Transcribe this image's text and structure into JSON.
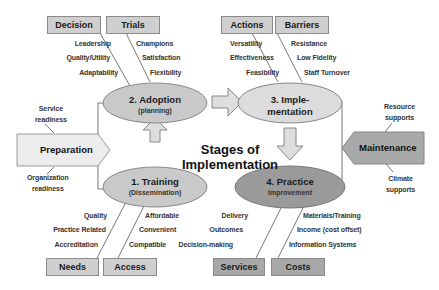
{
  "title": {
    "line1": "Stages of",
    "line2": "Implementation"
  },
  "stages": [
    {
      "id": "training",
      "title": "1. Training",
      "subtitle": "(Dissemination)",
      "fill": "#c9c9c9"
    },
    {
      "id": "adoption",
      "title": "2. Adoption",
      "subtitle": "(planning)",
      "fill": "#c9c9c9"
    },
    {
      "id": "implementation",
      "title": "3. Imple-",
      "subtitle": "mentation",
      "fill": "#dcdcdc"
    },
    {
      "id": "practice",
      "title": "4. Practice",
      "subtitle": "Improvement",
      "fill": "#9a9a9a"
    }
  ],
  "preparation": {
    "label": "Preparation",
    "top_note": [
      "Service",
      "readiness"
    ],
    "bottom_note": [
      "Organization",
      "readiness"
    ]
  },
  "maintenance": {
    "label": "Maintenance",
    "top_note": [
      "Resource",
      "supports"
    ],
    "bottom_note": [
      "Climate",
      "supports"
    ]
  },
  "factor_boxes": {
    "decision": {
      "label": "Decision",
      "items": [
        "Leadership",
        "Quality/Utility",
        "Adaptability"
      ]
    },
    "trials": {
      "label": "Trials",
      "items": [
        "Champions",
        "Satisfaction",
        "Flexibility"
      ]
    },
    "actions": {
      "label": "Actions",
      "items": [
        "Versatility",
        "Effectiveness",
        "Feasibility"
      ]
    },
    "barriers": {
      "label": "Barriers",
      "items": [
        "Resistance",
        "Low Fidelity",
        "Staff Turnover"
      ]
    },
    "needs": {
      "label": "Needs",
      "items": [
        "Quality",
        "Practice Related",
        "Accreditation"
      ]
    },
    "access": {
      "label": "Access",
      "items": [
        "Affordable",
        "Convenient",
        "Compatible"
      ]
    },
    "services": {
      "label": "Services",
      "items": [
        "Delivery",
        "Outcomes",
        "Decision-making"
      ]
    },
    "costs": {
      "label": "Costs",
      "items": [
        "Materials/Training",
        "Income (cost offset)",
        "Information Systems"
      ]
    }
  },
  "colors": {
    "light_box": "#cfcfcf",
    "dark_box": "#a8a8a8",
    "outline": "#8a8a8a",
    "arrow_fill": "#dedede",
    "preparation_fill": "#ececec",
    "maintenance_fill": "#a9a9a9"
  }
}
